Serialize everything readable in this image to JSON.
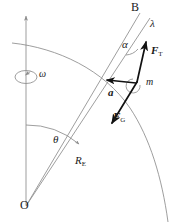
{
  "figure": {
    "type": "physics-vector-diagram",
    "stroke_thin": "#8c8c8c",
    "stroke_bold": "#111111",
    "text_color": "#1a1a1a",
    "background": "#ffffff"
  },
  "points": {
    "origin": {
      "label": "O",
      "x": 26,
      "y": 208
    },
    "apex": {
      "label": "B",
      "x": 140,
      "y": 8
    },
    "mass": {
      "label": "m",
      "x": 137,
      "y": 82
    }
  },
  "angles": {
    "theta": {
      "label": "θ",
      "x": 57,
      "y": 140,
      "meaning": "colatitude from rotation axis"
    },
    "alpha": {
      "label": "α",
      "x": 126,
      "y": 45,
      "meaning": "deflection angle at B"
    },
    "lambda": {
      "label": "λ",
      "x": 155,
      "y": 24,
      "meaning": "plumb line angle"
    },
    "omega": {
      "label": "ω",
      "x": 34,
      "y": 74,
      "meaning": "Earth angular velocity"
    }
  },
  "vectors": [
    {
      "name": "tension",
      "label": "F",
      "subscript": "T",
      "label_x": 152,
      "label_y": 50,
      "direction": "toward B"
    },
    {
      "name": "gravity",
      "label": "F",
      "subscript": "G",
      "label_x": 115,
      "label_y": 116,
      "direction": "toward O"
    },
    {
      "name": "acceleration",
      "label": "a",
      "subscript": "",
      "label_x": 110,
      "label_y": 92,
      "direction": "horizontal, toward axis"
    }
  ],
  "lengths": [
    {
      "name": "earth-radius",
      "label": "R",
      "subscript": "E",
      "label_x": 77,
      "label_y": 160
    }
  ],
  "elements": {
    "rotation_axis": "vertical line with upward arrowhead through O",
    "earth_surface": "arc curving from upper-left through mass point down to lower-right",
    "spin_indicator": "ellipse with arrow around the rotation axis"
  }
}
